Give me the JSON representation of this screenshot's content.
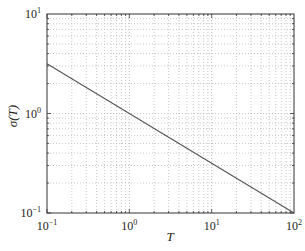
{
  "chart_data": {
    "type": "line",
    "title": "",
    "xlabel": "T",
    "ylabel": "σ(T)",
    "xscale": "log",
    "yscale": "log",
    "xlim": [
      0.1,
      100
    ],
    "ylim": [
      0.1,
      10
    ],
    "grid": true,
    "legend": null,
    "x_ticks": [
      {
        "base": "10",
        "exp": "−1",
        "value": 0.1
      },
      {
        "base": "10",
        "exp": "0",
        "value": 1
      },
      {
        "base": "10",
        "exp": "1",
        "value": 10
      },
      {
        "base": "10",
        "exp": "2",
        "value": 100
      }
    ],
    "y_ticks": [
      {
        "base": "10",
        "exp": "−1",
        "value": 0.1
      },
      {
        "base": "10",
        "exp": "0",
        "value": 1
      },
      {
        "base": "10",
        "exp": "1",
        "value": 10
      }
    ],
    "series": [
      {
        "name": "σ(T)",
        "color": "#555555",
        "x": [
          0.1,
          1,
          10,
          100
        ],
        "y": [
          3.16,
          1.0,
          0.316,
          0.1
        ]
      }
    ]
  },
  "labels": {
    "xlabel": "T",
    "ylabel_sigma": "σ",
    "ylabel_arg": "(T)"
  }
}
